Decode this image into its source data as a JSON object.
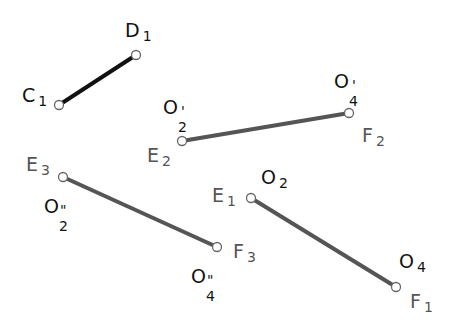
{
  "colors": {
    "segment_black": "#111111",
    "segment_gray": "#555555",
    "point_fill": "#ffffff",
    "point_stroke": "#666666"
  },
  "segments": [
    {
      "id": "C1D1",
      "x1": 59,
      "y1": 105,
      "x2": 136,
      "y2": 55,
      "color": "#111111",
      "width": 4
    },
    {
      "id": "E2F2",
      "x1": 182,
      "y1": 141,
      "x2": 349,
      "y2": 113,
      "color": "#555555",
      "width": 4
    },
    {
      "id": "E3F3",
      "x1": 63,
      "y1": 177,
      "x2": 217,
      "y2": 247,
      "color": "#555555",
      "width": 4
    },
    {
      "id": "E1F1",
      "x1": 251,
      "y1": 198,
      "x2": 396,
      "y2": 287,
      "color": "#555555",
      "width": 4
    }
  ],
  "labels": {
    "c1": {
      "main": "C",
      "sub": "1"
    },
    "d1": {
      "main": "D",
      "sub": "1"
    },
    "o2p": {
      "main": "O",
      "prime": "'",
      "sub": "2"
    },
    "e2": {
      "main": "E",
      "sub": "2"
    },
    "o4p": {
      "main": "O",
      "prime": "'",
      "sub": "4"
    },
    "f2": {
      "main": "F",
      "sub": "2"
    },
    "e3": {
      "main": "E",
      "sub": "3"
    },
    "o2pp": {
      "main": "O",
      "prime": "\"",
      "sub": "2"
    },
    "e1": {
      "main": "E",
      "sub": "1"
    },
    "o2": {
      "main": "O",
      "sub": "2"
    },
    "f3": {
      "main": "F",
      "sub": "3"
    },
    "o4pp": {
      "main": "O",
      "prime": "\"",
      "sub": "4"
    },
    "o4": {
      "main": "O",
      "sub": "4"
    },
    "f1": {
      "main": "F",
      "sub": "1"
    }
  }
}
